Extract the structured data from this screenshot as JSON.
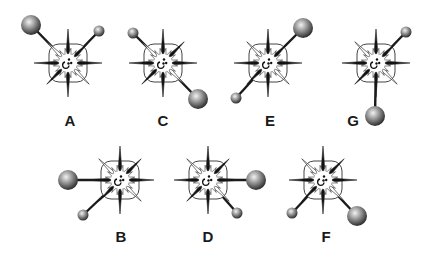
{
  "figure": {
    "items": [
      {
        "label": "A",
        "cx": 68,
        "cy": 63,
        "lx": 70,
        "ly": 126,
        "large": {
          "x": 31,
          "y": 25,
          "r": 10
        },
        "small": {
          "x": 99,
          "y": 31,
          "r": 5.5
        }
      },
      {
        "label": "C",
        "cx": 163,
        "cy": 63,
        "lx": 163,
        "ly": 126,
        "large": {
          "x": 198,
          "y": 99,
          "r": 10
        },
        "small": {
          "x": 133,
          "y": 33,
          "r": 5.5
        }
      },
      {
        "label": "E",
        "cx": 268,
        "cy": 63,
        "lx": 270,
        "ly": 126,
        "large": {
          "x": 303,
          "y": 28,
          "r": 10
        },
        "small": {
          "x": 236,
          "y": 98,
          "r": 5.5
        }
      },
      {
        "label": "G",
        "cx": 376,
        "cy": 63,
        "lx": 353,
        "ly": 126,
        "large": {
          "x": 375,
          "y": 116,
          "r": 10
        },
        "small": {
          "x": 406,
          "y": 32,
          "r": 5.5
        }
      },
      {
        "label": "B",
        "cx": 120,
        "cy": 180,
        "lx": 121,
        "ly": 242,
        "large": {
          "x": 68,
          "y": 180,
          "r": 10
        },
        "small": {
          "x": 83,
          "y": 215,
          "r": 5.5
        }
      },
      {
        "label": "D",
        "cx": 208,
        "cy": 180,
        "lx": 208,
        "ly": 242,
        "large": {
          "x": 256,
          "y": 180,
          "r": 10
        },
        "small": {
          "x": 237,
          "y": 213,
          "r": 5.5
        }
      },
      {
        "label": "F",
        "cx": 323,
        "cy": 180,
        "lx": 326,
        "ly": 242,
        "large": {
          "x": 357,
          "y": 216,
          "r": 10
        },
        "small": {
          "x": 292,
          "y": 213,
          "r": 5.5
        }
      }
    ]
  },
  "colors": {
    "ray": "#1a1a1a",
    "outline": "#333333",
    "sphere_light": "#e8e8e8",
    "sphere_dark": "#3a3a3a"
  }
}
